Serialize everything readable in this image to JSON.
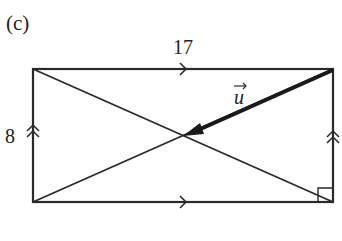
{
  "figure": {
    "part_label": "(c)",
    "top_side_label": "17",
    "left_side_label": "8",
    "vector_label": "u",
    "colors": {
      "line": "#2a2a2a",
      "background": "#ffffff"
    }
  },
  "shape": {
    "type": "rectangle",
    "width": 17,
    "height": 8,
    "diagonals": 2,
    "right_angle_marker": "bottom-right",
    "parallel_marks": {
      "horizontal_sides": "single-arrow",
      "vertical_sides": "double-arrow"
    },
    "vector": {
      "name": "u",
      "from": "top-right corner",
      "to": "diagonal intersection"
    }
  }
}
